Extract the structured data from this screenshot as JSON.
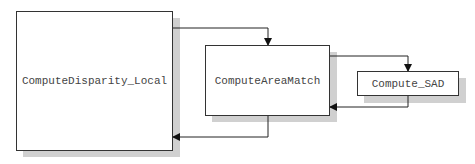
{
  "diagram": {
    "type": "call-graph",
    "nodes": [
      {
        "id": "local",
        "label": "ComputeDisparity_Local"
      },
      {
        "id": "area",
        "label": "ComputeAreaMatch"
      },
      {
        "id": "sad",
        "label": "Compute_SAD"
      }
    ],
    "edges": [
      {
        "from": "ComputeDisparity_Local",
        "to": "ComputeAreaMatch",
        "kind": "call"
      },
      {
        "from": "ComputeAreaMatch",
        "to": "ComputeDisparity_Local",
        "kind": "return"
      },
      {
        "from": "ComputeAreaMatch",
        "to": "Compute_SAD",
        "kind": "call"
      },
      {
        "from": "Compute_SAD",
        "to": "ComputeAreaMatch",
        "kind": "return"
      }
    ],
    "colors": {
      "line": "#222222",
      "shadow": "#d0d0d0",
      "box_fill": "#ffffff",
      "text": "#444444"
    }
  }
}
